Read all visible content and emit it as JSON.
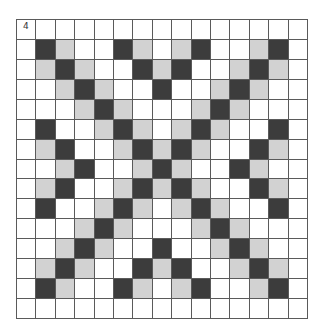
{
  "puzzle": {
    "number_label": "4",
    "rows": 15,
    "cols": 15,
    "legend": {
      "D": "dark",
      "L": "light",
      "W": "white"
    },
    "colors": {
      "dark": "#3c3c3c",
      "light": "#d2d2d2",
      "white": "#ffffff",
      "grid_line": "#5a5a5a"
    },
    "grid": [
      "WWWWWWWWWWWWWWW",
      "WDLWWDLWLDWWLDW",
      "WLDLWWDLDWWLDLW",
      "WWLDLWWDWWLDLWW",
      "WWWLDLWWWLDLWWW",
      "WDWWLDLWLDLWWDW",
      "WLDWWLDLDLWWDLW",
      "WWLDWWLDLWWDLWW",
      "WLDWWLDLDLWWDLW",
      "WDWWLDLWLDLWWDW",
      "WWWLDLWWWLDLWWW",
      "WWLDLWWDWWLDLWW",
      "WLDLWWDLDWWLDLW",
      "WDLWWDLWLDWWLDW",
      "WWWWWWWWWWWWWWW"
    ]
  }
}
